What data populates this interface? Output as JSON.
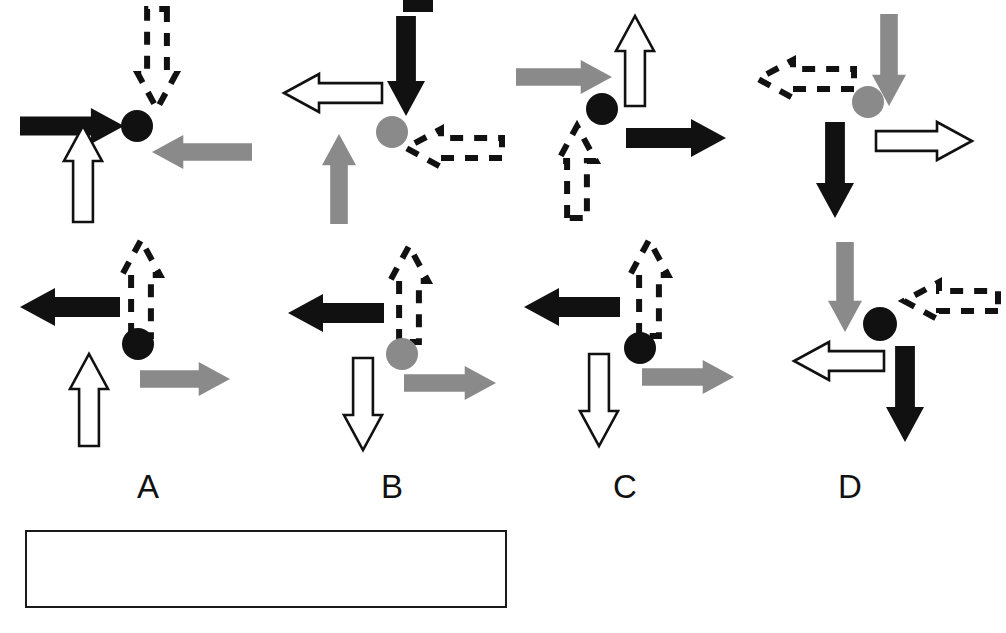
{
  "figure": {
    "title": "",
    "width": 1006,
    "height": 633,
    "background": "#ffffff",
    "colors": {
      "solid_black": "#111111",
      "solid_gray": "#8a8a8a",
      "outline_white_fill": "#ffffff",
      "outline_stroke": "#111111",
      "dashed_stroke": "#111111"
    },
    "arrow_styles": [
      {
        "key": "black",
        "name": "solid-black-arrow",
        "fill": "#111111",
        "stroke": "none",
        "dashed": false
      },
      {
        "key": "gray",
        "name": "solid-gray-arrow",
        "fill": "#8a8a8a",
        "stroke": "none",
        "dashed": false
      },
      {
        "key": "white",
        "name": "outline-white-arrow",
        "fill": "#ffffff",
        "stroke": "#111111",
        "dashed": false
      },
      {
        "key": "dashed",
        "name": "dashed-outline-arrow",
        "fill": "none",
        "stroke": "#111111",
        "dashed": true
      }
    ],
    "marker_styles": [
      {
        "key": "black",
        "name": "black-circle",
        "fill": "#111111"
      },
      {
        "key": "gray",
        "name": "gray-circle",
        "fill": "#8a8a8a"
      }
    ]
  },
  "columns": [
    {
      "id": "A",
      "label": "A",
      "label_x": 148,
      "label_y": 470
    },
    {
      "id": "B",
      "label": "B",
      "label_x": 392,
      "label_y": 470
    },
    {
      "id": "C",
      "label": "C",
      "label_x": 625,
      "label_y": 470
    },
    {
      "id": "D",
      "label": "D",
      "label_x": 850,
      "label_y": 470
    }
  ],
  "panels": [
    {
      "id": "A-top",
      "column": "A",
      "row": "top",
      "origin": {
        "x": 12,
        "y": 4
      },
      "size": {
        "w": 210,
        "h": 215
      },
      "circle": {
        "style": "black",
        "cx": 125,
        "cy": 122,
        "r": 16
      },
      "arrows": [
        {
          "style": "black",
          "direction": "right",
          "name": "arrow-black-right",
          "x": 8,
          "y": 104,
          "length": 104,
          "thickness": 36
        },
        {
          "style": "dashed",
          "direction": "down",
          "name": "arrow-dashed-down",
          "x": 126,
          "y": 5,
          "length": 100,
          "thickness": 38
        },
        {
          "style": "gray",
          "direction": "left",
          "name": "arrow-gray-left",
          "x": 140,
          "y": 131,
          "length": 100,
          "thickness": 34
        },
        {
          "style": "white",
          "direction": "up",
          "name": "arrow-white-up",
          "x": 52,
          "y": 122,
          "length": 96,
          "thickness": 38
        }
      ]
    },
    {
      "id": "B-top",
      "column": "B",
      "row": "top",
      "origin": {
        "x": 272,
        "y": 4
      },
      "size": {
        "w": 230,
        "h": 215
      },
      "circle": {
        "style": "gray",
        "cx": 120,
        "cy": 128,
        "r": 16
      },
      "arrows": [
        {
          "style": "black",
          "direction": "down",
          "name": "arrow-black-down",
          "x": 115,
          "y": 12,
          "length": 100,
          "thickness": 38
        },
        {
          "style": "white",
          "direction": "left",
          "name": "arrow-white-left",
          "x": 12,
          "y": 70,
          "length": 98,
          "thickness": 38
        },
        {
          "style": "gray",
          "direction": "up",
          "name": "arrow-gray-up",
          "x": 50,
          "y": 130,
          "length": 90,
          "thickness": 34
        },
        {
          "style": "dashed",
          "direction": "left",
          "name": "arrow-dashed-left",
          "x": 134,
          "y": 125,
          "length": 96,
          "thickness": 38
        }
      ]
    },
    {
      "id": "C-top",
      "column": "C",
      "row": "top",
      "origin": {
        "x": 516,
        "y": 4
      },
      "size": {
        "w": 230,
        "h": 215
      },
      "circle": {
        "style": "black",
        "cx": 86,
        "cy": 105,
        "r": 16
      },
      "arrows": [
        {
          "style": "gray",
          "direction": "right",
          "name": "arrow-gray-right",
          "x": 0,
          "y": 56,
          "length": 96,
          "thickness": 34
        },
        {
          "style": "white",
          "direction": "up",
          "name": "arrow-white-up",
          "x": 100,
          "y": 12,
          "length": 90,
          "thickness": 38
        },
        {
          "style": "black",
          "direction": "right",
          "name": "arrow-black-right",
          "x": 110,
          "y": 115,
          "length": 100,
          "thickness": 38
        },
        {
          "style": "dashed",
          "direction": "up",
          "name": "arrow-dashed-up",
          "x": 42,
          "y": 122,
          "length": 92,
          "thickness": 38
        }
      ]
    },
    {
      "id": "D-top",
      "column": "D",
      "row": "top",
      "origin": {
        "x": 740,
        "y": 4
      },
      "size": {
        "w": 250,
        "h": 225
      },
      "circle": {
        "style": "gray",
        "cx": 128,
        "cy": 98,
        "r": 16
      },
      "arrows": [
        {
          "style": "gray",
          "direction": "down",
          "name": "arrow-gray-down",
          "x": 132,
          "y": 10,
          "length": 92,
          "thickness": 34
        },
        {
          "style": "dashed",
          "direction": "left",
          "name": "arrow-dashed-left",
          "x": 18,
          "y": 56,
          "length": 96,
          "thickness": 38
        },
        {
          "style": "black",
          "direction": "down",
          "name": "arrow-black-down",
          "x": 76,
          "y": 118,
          "length": 96,
          "thickness": 38
        },
        {
          "style": "white",
          "direction": "right",
          "name": "arrow-white-right",
          "x": 136,
          "y": 118,
          "length": 96,
          "thickness": 38
        }
      ]
    },
    {
      "id": "A-bottom",
      "column": "A",
      "row": "bottom",
      "origin": {
        "x": 12,
        "y": 236
      },
      "size": {
        "w": 230,
        "h": 215
      },
      "circle": {
        "style": "black",
        "cx": 126,
        "cy": 108,
        "r": 16
      },
      "arrows": [
        {
          "style": "black",
          "direction": "left",
          "name": "arrow-black-left",
          "x": 8,
          "y": 52,
          "length": 100,
          "thickness": 38
        },
        {
          "style": "dashed",
          "direction": "up",
          "name": "arrow-dashed-up",
          "x": 110,
          "y": 4,
          "length": 96,
          "thickness": 38
        },
        {
          "style": "white",
          "direction": "up",
          "name": "arrow-white-up",
          "x": 58,
          "y": 118,
          "length": 92,
          "thickness": 38
        },
        {
          "style": "gray",
          "direction": "right",
          "name": "arrow-gray-right",
          "x": 128,
          "y": 126,
          "length": 90,
          "thickness": 34
        }
      ]
    },
    {
      "id": "B-bottom",
      "column": "B",
      "row": "bottom",
      "origin": {
        "x": 272,
        "y": 236
      },
      "size": {
        "w": 230,
        "h": 215
      },
      "circle": {
        "style": "gray",
        "cx": 130,
        "cy": 118,
        "r": 16
      },
      "arrows": [
        {
          "style": "black",
          "direction": "left",
          "name": "arrow-black-left",
          "x": 16,
          "y": 58,
          "length": 96,
          "thickness": 38
        },
        {
          "style": "dashed",
          "direction": "up",
          "name": "arrow-dashed-up",
          "x": 118,
          "y": 10,
          "length": 96,
          "thickness": 38
        },
        {
          "style": "white",
          "direction": "down",
          "name": "arrow-white-down",
          "x": 72,
          "y": 122,
          "length": 92,
          "thickness": 38
        },
        {
          "style": "gray",
          "direction": "right",
          "name": "arrow-gray-right",
          "x": 132,
          "y": 130,
          "length": 92,
          "thickness": 34
        }
      ]
    },
    {
      "id": "C-bottom",
      "column": "C",
      "row": "bottom",
      "origin": {
        "x": 502,
        "y": 236
      },
      "size": {
        "w": 230,
        "h": 215
      },
      "circle": {
        "style": "black",
        "cx": 138,
        "cy": 112,
        "r": 16
      },
      "arrows": [
        {
          "style": "black",
          "direction": "left",
          "name": "arrow-black-left",
          "x": 22,
          "y": 52,
          "length": 96,
          "thickness": 38
        },
        {
          "style": "dashed",
          "direction": "up",
          "name": "arrow-dashed-up",
          "x": 128,
          "y": 4,
          "length": 96,
          "thickness": 38
        },
        {
          "style": "white",
          "direction": "down",
          "name": "arrow-white-down",
          "x": 78,
          "y": 118,
          "length": 92,
          "thickness": 38
        },
        {
          "style": "gray",
          "direction": "right",
          "name": "arrow-gray-right",
          "x": 140,
          "y": 124,
          "length": 92,
          "thickness": 34
        }
      ]
    },
    {
      "id": "D-bottom",
      "column": "D",
      "row": "bottom",
      "origin": {
        "x": 740,
        "y": 236
      },
      "size": {
        "w": 250,
        "h": 225
      },
      "circle": {
        "style": "black",
        "cx": 140,
        "cy": 88,
        "r": 17
      },
      "arrows": [
        {
          "style": "gray",
          "direction": "down",
          "name": "arrow-gray-down",
          "x": 88,
          "y": 6,
          "length": 90,
          "thickness": 34
        },
        {
          "style": "dashed",
          "direction": "left",
          "name": "arrow-dashed-left",
          "x": 164,
          "y": 46,
          "length": 94,
          "thickness": 38
        },
        {
          "style": "white",
          "direction": "left",
          "name": "arrow-white-left",
          "x": 54,
          "y": 106,
          "length": 90,
          "thickness": 38
        },
        {
          "style": "black",
          "direction": "down",
          "name": "arrow-black-down",
          "x": 146,
          "y": 110,
          "length": 96,
          "thickness": 38
        }
      ]
    }
  ],
  "caption_box": {
    "name": "caption-box",
    "text": "",
    "x": 25,
    "y": 530,
    "width": 482,
    "height": 78,
    "border_color": "#1a1a1a"
  },
  "top_fragment": {
    "name": "cropped-text-fragment",
    "x": 403,
    "y": 0,
    "width": 30,
    "height": 12
  }
}
